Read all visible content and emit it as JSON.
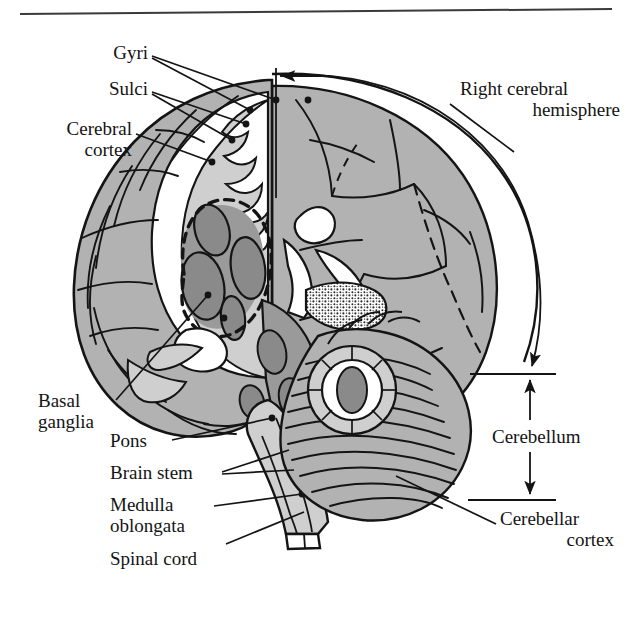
{
  "figure": {
    "type": "anatomical-diagram",
    "background": "#ffffff",
    "rule": {
      "present": true,
      "y": 12
    },
    "palette": {
      "ink": "#141414",
      "cortex_gray": "#b2b2b2",
      "light_gray": "#cfcfcf",
      "dark_nucleus": "#8a8a8a",
      "mid_gray": "#9a9a9a",
      "white": "#ffffff"
    }
  },
  "labels": {
    "gyri": "Gyri",
    "sulci": "Sulci",
    "cerebral_cortex_line1": "Cerebral",
    "cerebral_cortex_line2": "cortex",
    "right_hemisphere_line1": "Right cerebral",
    "right_hemisphere_line2": "hemisphere",
    "basal_ganglia_line1": "Basal",
    "basal_ganglia_line2": "ganglia",
    "pons": "Pons",
    "brain_stem": "Brain stem",
    "medulla_line1": "Medulla",
    "medulla_line2": "oblongata",
    "spinal_cord": "Spinal cord",
    "cerebellum": "Cerebellum",
    "cerebellar_cortex_line1": "Cerebellar",
    "cerebellar_cortex_line2": "cortex"
  },
  "annotations": {
    "hemisphere_arc": "sweeping arc from midline arrow around right hemisphere down to cerebellum",
    "midline_arrow": "leftward arrow at midline marking the cut plane",
    "cerebellum_bracket": "double headed vertical dimension arrow between two tick rules"
  }
}
